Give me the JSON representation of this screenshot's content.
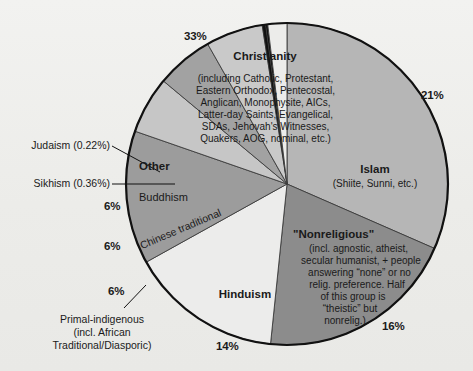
{
  "figure": {
    "background_color": "#efefed",
    "outline_color": "#111111"
  },
  "chart_data": {
    "type": "pie",
    "title": "",
    "subtitle": "",
    "xlabel": "",
    "ylabel": "",
    "legend_position": "none",
    "grid": false,
    "units": "percent of world population",
    "categories": [
      "Christianity",
      "Islam",
      "\"Nonreligious\"",
      "Hinduism",
      "Primal-indigenous",
      "Chinese traditional",
      "Buddhism",
      "Sikhism",
      "Judaism",
      "Other"
    ],
    "values": [
      33,
      21,
      16,
      14,
      6,
      6,
      6,
      0.36,
      0.22,
      2.0
    ],
    "labels": [
      "33%",
      "21%",
      "16%",
      "14%",
      "6%",
      "6%",
      "6%",
      "0.36%",
      "0.22%",
      ""
    ],
    "slices": [
      {
        "name": "Christianity",
        "value": 33,
        "percent_label": "33%",
        "color": "#b6b6b6",
        "title": "Christianity",
        "detail": "(including Catholic, Protestant,\nEastern Orthodox, Pentecostal,\nAnglican, Monophysite, AICs,\nLatter-day Saints, Evangelical,\nSDAs, Jehovah's Witnesses,\nQuakers, AOG, nominal, etc.)"
      },
      {
        "name": "Islam",
        "value": 21,
        "percent_label": "21%",
        "color": "#8c8c8c",
        "title": "Islam",
        "detail": "(Shiite, Sunni, etc.)"
      },
      {
        "name": "Nonreligious",
        "value": 16,
        "percent_label": "16%",
        "color": "#ececeb",
        "title": "\"Nonreligious\"",
        "detail": "(incl. agnostic, atheist,\nsecular humanist, + people\nanswering \"none\" or no\nrelig. preference. Half\nof this group is\n\"theistic\" but\nnonrelig.)"
      },
      {
        "name": "Hinduism",
        "value": 14,
        "percent_label": "14%",
        "color": "#9c9c9c",
        "title": "Hinduism",
        "detail": ""
      },
      {
        "name": "Primal-indigenous",
        "value": 6,
        "percent_label": "6%",
        "color": "#c6c6c6",
        "title": "Primal-indigenous",
        "detail": "(incl. African\nTraditional/Diasporic)"
      },
      {
        "name": "Chinese traditional",
        "value": 6,
        "percent_label": "6%",
        "color": "#a2a2a2",
        "title": "Chinese traditional",
        "detail": ""
      },
      {
        "name": "Buddhism",
        "value": 6,
        "percent_label": "6%",
        "color": "#c9c9c9",
        "title": "Buddhism",
        "detail": ""
      },
      {
        "name": "Sikhism",
        "value": 0.36,
        "percent_label": "0.36%",
        "color": "#111111",
        "title": "Sikhism (0.36%)",
        "detail": ""
      },
      {
        "name": "Judaism",
        "value": 0.22,
        "percent_label": "0.22%",
        "color": "#111111",
        "title": "Judaism (0.22%)",
        "detail": ""
      },
      {
        "name": "Other",
        "value": 2.0,
        "percent_label": "",
        "color": "#ececea",
        "title": "Other",
        "detail": ""
      }
    ]
  },
  "labels": {
    "christianity_title": "Christianity",
    "christianity_detail_l1": "(including Catholic, Protestant,",
    "christianity_detail_l2": "Eastern Orthodox, Pentecostal,",
    "christianity_detail_l3": "Anglican, Monophysite, AICs,",
    "christianity_detail_l4": "Latter-day Saints, Evangelical,",
    "christianity_detail_l5": "SDAs, Jehovah's Witnesses,",
    "christianity_detail_l6": "Quakers, AOG, nominal, etc.)",
    "christianity_pct": "33%",
    "islam_title": "Islam",
    "islam_detail": "(Shiite, Sunni, etc.)",
    "islam_pct": "21%",
    "nonreligious_title": "\"Nonreligious\"",
    "nonreligious_l1": "(incl. agnostic, atheist,",
    "nonreligious_l2": "secular humanist, + people",
    "nonreligious_l3": "answering “none” or no",
    "nonreligious_l4": "relig. preference. Half",
    "nonreligious_l5": "of this group is",
    "nonreligious_l6": "“theistic” but",
    "nonreligious_l7": "nonrelig.)",
    "nonreligious_pct": "16%",
    "hinduism_title": "Hinduism",
    "hinduism_pct": "14%",
    "primal_l1": "Primal-indigenous",
    "primal_l2": "(incl. African",
    "primal_l3": "Traditional/Diasporic)",
    "primal_pct": "6%",
    "chinese_title": "Chinese traditional",
    "chinese_pct": "6%",
    "buddhism_title": "Buddhism",
    "buddhism_pct": "6%",
    "other_title": "Other",
    "sikhism_callout": "Sikhism (0.36%)",
    "judaism_callout": "Judaism (0.22%)"
  }
}
